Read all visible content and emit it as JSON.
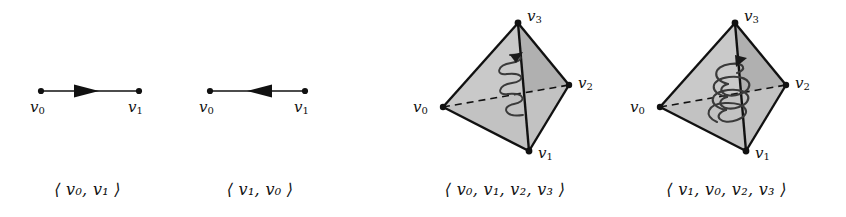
{
  "figure": {
    "background_color": "#ffffff",
    "ink_color": "#111111",
    "face_fill_light": "#c9c9c9",
    "face_fill_dark": "#b0b0b0"
  },
  "panels": [
    {
      "id": "edge-forward",
      "type": "oriented-1-simplex",
      "caption": "⟨ v₀, v₁ ⟩",
      "caption_parts": {
        "open": "⟨",
        "items": [
          "v0",
          "v1"
        ],
        "close": "⟩"
      },
      "arrow_direction": "right",
      "vertices": [
        {
          "name": "v0",
          "label": "v",
          "sub": "0",
          "x": 41,
          "y": 91,
          "label_x": 30,
          "label_y": 98
        },
        {
          "name": "v1",
          "label": "v",
          "sub": "1",
          "x": 139,
          "y": 91,
          "label_x": 128,
          "label_y": 98
        }
      ]
    },
    {
      "id": "edge-backward",
      "type": "oriented-1-simplex",
      "caption": "⟨ v₁, v₀ ⟩",
      "caption_parts": {
        "open": "⟨",
        "items": [
          "v1",
          "v0"
        ],
        "close": "⟩"
      },
      "arrow_direction": "left",
      "vertices": [
        {
          "name": "v0",
          "label": "v",
          "sub": "0",
          "x": 210,
          "y": 91,
          "label_x": 199,
          "label_y": 98
        },
        {
          "name": "v1",
          "label": "v",
          "sub": "1",
          "x": 305,
          "y": 91,
          "label_x": 294,
          "label_y": 98
        }
      ]
    },
    {
      "id": "tetrahedron-left",
      "type": "oriented-3-simplex",
      "caption": "⟨ v₀, v₁, v₂, v₃ ⟩",
      "caption_parts": {
        "open": "⟨",
        "items": [
          "v0",
          "v1",
          "v2",
          "v3"
        ],
        "close": "⟩"
      },
      "helix": {
        "style": "narrow",
        "arrow_head": "top",
        "rotation": "counterclockwise"
      },
      "vertices": [
        {
          "name": "v3",
          "label": "v",
          "sub": "3",
          "x": 518,
          "y": 23,
          "label_x": 527,
          "label_y": 7
        },
        {
          "name": "v2",
          "label": "v",
          "sub": "2",
          "x": 569,
          "y": 85,
          "label_x": 578,
          "label_y": 74
        },
        {
          "name": "v0",
          "label": "v",
          "sub": "0",
          "x": 443,
          "y": 107,
          "label_x": 413,
          "label_y": 98
        },
        {
          "name": "v1",
          "label": "v",
          "sub": "1",
          "x": 529,
          "y": 151,
          "label_x": 538,
          "label_y": 144
        }
      ]
    },
    {
      "id": "tetrahedron-right",
      "type": "oriented-3-simplex",
      "caption": "⟨ v₁, v₀, v₂, v₃ ⟩",
      "caption_parts": {
        "open": "⟨",
        "items": [
          "v1",
          "v0",
          "v2",
          "v3"
        ],
        "close": "⟩"
      },
      "helix": {
        "style": "wide",
        "arrow_head": "top",
        "rotation": "clockwise"
      },
      "vertices": [
        {
          "name": "v3",
          "label": "v",
          "sub": "3",
          "x": 735,
          "y": 23,
          "label_x": 744,
          "label_y": 7
        },
        {
          "name": "v2",
          "label": "v",
          "sub": "2",
          "x": 786,
          "y": 85,
          "label_x": 795,
          "label_y": 74
        },
        {
          "name": "v0",
          "label": "v",
          "sub": "0",
          "x": 660,
          "y": 107,
          "label_x": 630,
          "label_y": 98
        },
        {
          "name": "v1",
          "label": "v",
          "sub": "1",
          "x": 746,
          "y": 151,
          "label_x": 755,
          "label_y": 144
        }
      ]
    }
  ]
}
